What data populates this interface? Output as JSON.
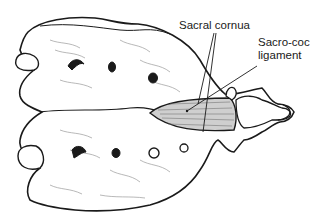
{
  "figure": {
    "labels": [
      {
        "id": "sacral-cornua",
        "text": "Sacral cornua"
      },
      {
        "id": "sacro-coc-ligament",
        "lines": [
          "Sacro-coc",
          "ligament"
        ]
      }
    ],
    "colors": {
      "outline": "#1a1a1a",
      "shading": "#bdbdbd",
      "ligament_fill": "#cfcfcf",
      "background": "#ffffff"
    }
  }
}
